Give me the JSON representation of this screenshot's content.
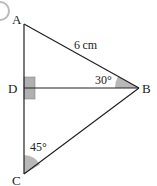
{
  "diagram": {
    "type": "triangle-with-altitude",
    "vertices": {
      "A": {
        "label": "A",
        "x": 24,
        "y": 24
      },
      "B": {
        "label": "B",
        "x": 139,
        "y": 88
      },
      "C": {
        "label": "C",
        "x": 24,
        "y": 174
      },
      "D": {
        "label": "D",
        "x": 24,
        "y": 88
      }
    },
    "labels": {
      "A": "A",
      "B": "B",
      "C": "C",
      "D": "D",
      "side_AB": "6 cm",
      "angle_B": "30°",
      "angle_C": "45°"
    },
    "right_angle_at": "D",
    "colors": {
      "line": "#222222",
      "angle_fill": "#b8b8b8",
      "right_angle_fill": "#b0b0b0"
    }
  }
}
